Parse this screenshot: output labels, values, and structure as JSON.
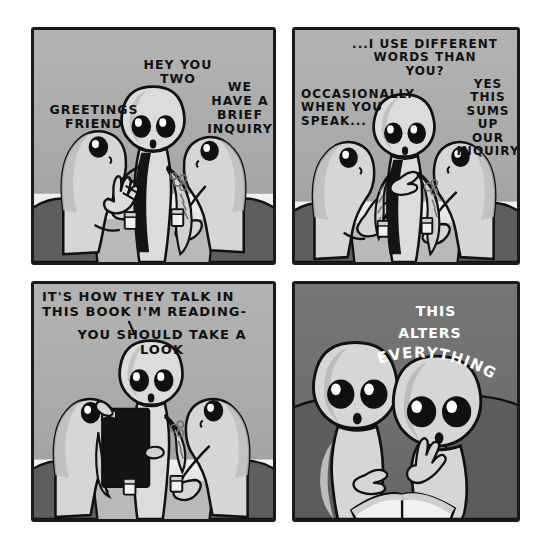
{
  "comic": {
    "title": "Alien conversation comic",
    "page_width": 551,
    "page_height": 549,
    "page_background": "#ffffff",
    "panel_border_color": "#1a1a1a",
    "palette": {
      "panel_bg_light_top": "#b0b0b0",
      "panel_bg_light_bottom": "#9a9a9a",
      "panel_bg_dark": "#6e6e6e",
      "character_body": "#d6d6d6",
      "character_shade": "#b4b4b4",
      "outline": "#111111",
      "chair_dark": "#5e5e5e",
      "table_light": "#efefef",
      "table_mid": "#b9b9b9",
      "book_black": "#141414",
      "eye_black": "#101010",
      "eye_highlight": "#ffffff",
      "text_dark": "#111111",
      "text_light": "#ffffff"
    },
    "panels": [
      {
        "id": "panel-1",
        "index": 1,
        "background_style": "light",
        "captions": [
          {
            "name": "caption-greetings-friend",
            "text": "GREETINGS\nFRIEND",
            "align": "center",
            "x": 8,
            "y": 75,
            "width": 110,
            "color": "dark"
          },
          {
            "name": "caption-hey-you-two",
            "text": "HEY YOU\nTWO",
            "align": "center",
            "x": 92,
            "y": 30,
            "width": 110,
            "color": "dark"
          },
          {
            "name": "caption-we-have-a-brief-inquiry",
            "text": "WE\nHAVE A\nBRIEF\nINQUIRY",
            "align": "center",
            "x": 172,
            "y": 52,
            "width": 72,
            "color": "dark"
          }
        ],
        "characters": [
          {
            "name": "character-left-alien",
            "pose": "seated-side-facing-right",
            "eyes_visible": 1
          },
          {
            "name": "character-center-alien",
            "pose": "standing-facing-viewer",
            "eyes_visible": 2,
            "features": [
              "dark-vest",
              "tattooed-arm",
              "raised-hands"
            ]
          },
          {
            "name": "character-right-alien",
            "pose": "seated-side-facing-left",
            "eyes_visible": 1
          }
        ],
        "props": [
          {
            "name": "drinking-cup-left"
          },
          {
            "name": "drinking-cup-right"
          },
          {
            "name": "table-surface"
          },
          {
            "name": "chair-back-left"
          },
          {
            "name": "chair-back-right"
          }
        ]
      },
      {
        "id": "panel-2",
        "index": 2,
        "background_style": "light",
        "captions": [
          {
            "name": "caption-i-use-different-words",
            "text": "...I USE DIFFERENT\nWORDS THAN\nYOU?",
            "align": "center",
            "x": 50,
            "y": 10,
            "width": 160,
            "color": "dark"
          },
          {
            "name": "caption-occasionally-when-you-speak",
            "text": "OCCASIONALLY\nWHEN YOU\nSPEAK...",
            "align": "left",
            "x": 6,
            "y": 60,
            "width": 86,
            "color": "dark"
          },
          {
            "name": "caption-yes-this-sums-up-our-inquiry",
            "text": "YES\nTHIS\nSUMS UP\nOUR\nINQUIRY",
            "align": "center",
            "x": 168,
            "y": 50,
            "width": 72,
            "color": "dark"
          }
        ],
        "characters": [
          {
            "name": "character-left-alien",
            "pose": "seated-side-facing-right",
            "eyes_visible": 1
          },
          {
            "name": "character-center-alien",
            "pose": "standing-facing-viewer",
            "eyes_visible": 2,
            "features": [
              "dark-vest",
              "tattooed-arm",
              "gesturing-hand"
            ]
          },
          {
            "name": "character-right-alien",
            "pose": "seated-side-facing-left",
            "eyes_visible": 1
          }
        ],
        "props": [
          {
            "name": "drinking-cup-left"
          },
          {
            "name": "drinking-cup-right"
          },
          {
            "name": "table-surface"
          },
          {
            "name": "chair-back-left"
          },
          {
            "name": "chair-back-right"
          }
        ]
      },
      {
        "id": "panel-3",
        "index": 3,
        "background_style": "light",
        "captions": [
          {
            "name": "caption-its-how-they-talk",
            "text": "IT'S HOW THEY TALK IN\nTHIS BOOK I'M READING-",
            "align": "left",
            "x": 10,
            "y": 8,
            "width": 220,
            "color": "dark"
          },
          {
            "name": "caption-you-should-take-a-look",
            "text": "YOU SHOULD TAKE A LOOK",
            "align": "center",
            "x": 24,
            "y": 46,
            "width": 210,
            "color": "dark"
          }
        ],
        "characters": [
          {
            "name": "character-left-alien",
            "pose": "seated-side-facing-right",
            "eyes_visible": 1
          },
          {
            "name": "character-center-alien",
            "pose": "standing-holding-book",
            "eyes_visible": 2,
            "features": [
              "tattooed-arm",
              "holding-black-book"
            ]
          },
          {
            "name": "character-right-alien",
            "pose": "seated-side-facing-left",
            "eyes_visible": 1
          }
        ],
        "props": [
          {
            "name": "black-book"
          },
          {
            "name": "drinking-cup-left"
          },
          {
            "name": "drinking-cup-right"
          },
          {
            "name": "table-surface"
          },
          {
            "name": "chair-back-left"
          },
          {
            "name": "chair-back-right"
          }
        ]
      },
      {
        "id": "panel-4",
        "index": 4,
        "background_style": "dark",
        "captions": [
          {
            "name": "caption-this",
            "text": "THIS",
            "align": "center",
            "x": 108,
            "y": 22,
            "width": 70,
            "color": "light"
          },
          {
            "name": "caption-alters",
            "text": "ALTERS",
            "align": "center",
            "x": 92,
            "y": 42,
            "width": 90,
            "color": "light"
          }
        ],
        "arc_caption": {
          "name": "caption-everything",
          "text": "EVERYTHING",
          "color": "light"
        },
        "characters": [
          {
            "name": "character-left-alien",
            "pose": "seated-facing-viewer-reading",
            "eyes_visible": 2
          },
          {
            "name": "character-right-alien",
            "pose": "seated-facing-viewer-reading",
            "eyes_visible": 2
          }
        ],
        "props": [
          {
            "name": "open-book"
          },
          {
            "name": "couch-back"
          }
        ]
      }
    ]
  }
}
